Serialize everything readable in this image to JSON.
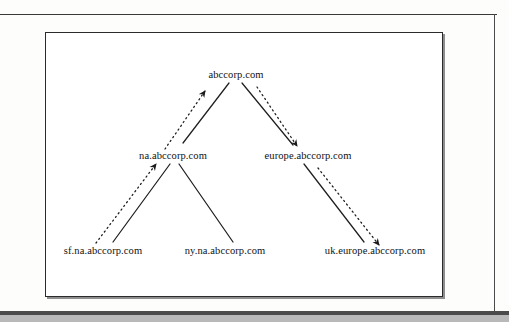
{
  "figure": {
    "type": "tree-diagram",
    "nodes": [
      {
        "id": "root",
        "label": "abccorp.com",
        "level": 0,
        "cx": 235,
        "cy": 74
      },
      {
        "id": "na",
        "label": "na.abccorp.com",
        "level": 1,
        "cx": 172,
        "cy": 155
      },
      {
        "id": "europe",
        "label": "europe.abccorp.com",
        "level": 1,
        "cx": 307,
        "cy": 155
      },
      {
        "id": "sf",
        "label": "sf.na.abccorp.com",
        "level": 2,
        "cx": 102,
        "cy": 250
      },
      {
        "id": "ny",
        "label": "ny.na.abccorp.com",
        "level": 2,
        "cx": 224,
        "cy": 250
      },
      {
        "id": "uk",
        "label": "uk.europe.abccorp.com",
        "level": 2,
        "cx": 374,
        "cy": 250
      }
    ],
    "structure_links": [
      {
        "from": "root",
        "to": "na",
        "style": "solid"
      },
      {
        "from": "root",
        "to": "europe",
        "style": "solid"
      },
      {
        "from": "na",
        "to": "sf",
        "style": "solid"
      },
      {
        "from": "na",
        "to": "ny",
        "style": "solid"
      },
      {
        "from": "europe",
        "to": "uk",
        "style": "solid"
      }
    ],
    "trust_arrows": [
      {
        "from": "na",
        "to": "root",
        "style": "dotted",
        "direction": "up-right",
        "arrowhead": true
      },
      {
        "from": "root",
        "to": "europe",
        "style": "dotted",
        "direction": "down-right",
        "arrowhead": true
      },
      {
        "from": "sf",
        "to": "na",
        "style": "dotted",
        "direction": "up-right",
        "arrowhead": true
      },
      {
        "from": "europe",
        "to": "uk",
        "style": "dotted",
        "direction": "down-right",
        "arrowhead": true
      }
    ],
    "colors": {
      "line": "#1f1f1f",
      "frame": "#2b2b2b",
      "text": "#111111",
      "page": "#fdfdfc",
      "band": "#4c4c4c"
    }
  }
}
